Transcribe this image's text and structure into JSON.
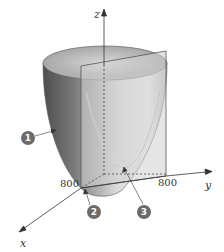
{
  "diagram": {
    "type": "3d-surface-cross-section",
    "surface": "paraboloid",
    "axes": {
      "x": {
        "label": "x",
        "tick_label": "800"
      },
      "y": {
        "label": "y",
        "tick_label": "800"
      },
      "z": {
        "label": "z"
      }
    },
    "callouts": [
      {
        "id": 1,
        "label": "1",
        "target": "paraboloid-surface"
      },
      {
        "id": 2,
        "label": "2",
        "target": "origin-corner"
      },
      {
        "id": 3,
        "label": "3",
        "target": "cross-section-curve"
      }
    ],
    "colors": {
      "surface_dark": "#5a5a5a",
      "surface_light": "#e6e6e6",
      "plane": "#c8c8c8",
      "axis": "#333333",
      "callout_bg": "#6b6b6b"
    }
  }
}
